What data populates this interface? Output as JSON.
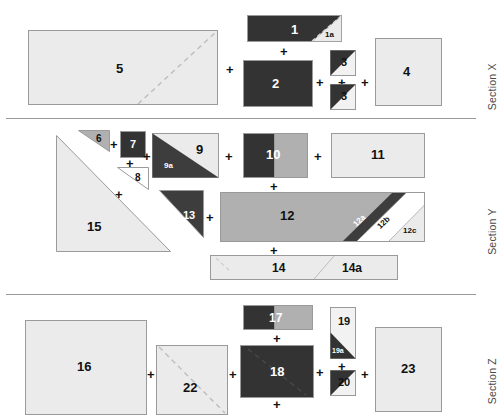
{
  "figure": {
    "background": "#ffffff",
    "width": 488,
    "height": 410
  },
  "palette": {
    "dark": "#333333",
    "mid_gray": "#b0b0b0",
    "light_gray": "#ebebeb",
    "very_light": "#f2f2f2",
    "white": "#ffffff",
    "outline": "#9a9a9a",
    "rule": "#9a9a9a",
    "label_dark": "#111111",
    "label_light": "#ffffff",
    "section_text": "#4a4a4a"
  },
  "sections": [
    {
      "id": "x",
      "label": "Section X"
    },
    {
      "id": "y",
      "label": "Section Y"
    },
    {
      "id": "z",
      "label": "Section Z"
    }
  ],
  "shapes": {
    "s1": {
      "label": "1",
      "fill": "dark"
    },
    "s1a": {
      "label": "1a",
      "fill": "light_gray"
    },
    "s2": {
      "label": "2",
      "fill": "dark"
    },
    "s3a": {
      "label": "3",
      "fill": "dark"
    },
    "s3b": {
      "label": "3",
      "fill": "dark"
    },
    "s4": {
      "label": "4",
      "fill": "light_gray"
    },
    "s5": {
      "label": "5",
      "fill": "light_gray"
    },
    "s6": {
      "label": "6",
      "fill": "mid_gray"
    },
    "s7": {
      "label": "7",
      "fill": "dark"
    },
    "s8": {
      "label": "8",
      "fill": "white"
    },
    "s9": {
      "label": "9",
      "fill": "light_gray"
    },
    "s9a": {
      "label": "9a",
      "fill": "dark"
    },
    "s10": {
      "label": "10",
      "fill": "dark"
    },
    "s11": {
      "label": "11",
      "fill": "light_gray"
    },
    "s12": {
      "label": "12",
      "fill": "mid_gray"
    },
    "s12a": {
      "label": "12a",
      "fill": "dark"
    },
    "s12b": {
      "label": "12b",
      "fill": "white"
    },
    "s12c": {
      "label": "12c",
      "fill": "light_gray"
    },
    "s13": {
      "label": "13",
      "fill": "dark"
    },
    "s14": {
      "label": "14",
      "fill": "light_gray"
    },
    "s14a": {
      "label": "14a",
      "fill": "light_gray"
    },
    "s15": {
      "label": "15",
      "fill": "light_gray"
    },
    "s16": {
      "label": "16",
      "fill": "light_gray"
    },
    "s17": {
      "label": "17",
      "fill": "dark"
    },
    "s18": {
      "label": "18",
      "fill": "dark"
    },
    "s19": {
      "label": "19",
      "fill": "light_gray"
    },
    "s19a": {
      "label": "19a",
      "fill": "dark"
    },
    "s20": {
      "label": "20",
      "fill": "dark"
    },
    "s22": {
      "label": "22",
      "fill": "light_gray"
    },
    "s23": {
      "label": "23",
      "fill": "light_gray"
    }
  },
  "operators": {
    "plus": "+"
  }
}
